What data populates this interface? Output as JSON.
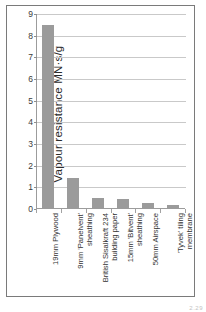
{
  "chart_data": {
    "type": "bar",
    "title": "",
    "xlabel": "",
    "ylabel": "Vapour resistance MN·s/g",
    "ylim": [
      0,
      9
    ],
    "yticks": [
      0,
      1,
      2,
      3,
      4,
      5,
      6,
      7,
      8,
      9
    ],
    "grid": true,
    "legend": "none",
    "bar_color": "#9b9b9b",
    "categories": [
      "19mm Plywood",
      "9mm 'Panelvent' sheathing",
      "British Sisalkraft 234 building paper",
      "15mm 'Bitvent' sheathing",
      "50mm Airspace",
      "'Tyvek' tiling membrane"
    ],
    "category_lines": [
      "19mm Plywood",
      "9mm 'Panelvent'\nsheathing",
      "British Sisalkraft 234\nbuilding paper",
      "15mm 'Bitvent'\nsheathing",
      "50mm Airspace",
      "'Tyvek' tiling\nmembrane"
    ],
    "values": [
      8.5,
      1.45,
      0.5,
      0.48,
      0.28,
      0.17
    ]
  },
  "figure": {
    "corner_mark": "2.29"
  }
}
